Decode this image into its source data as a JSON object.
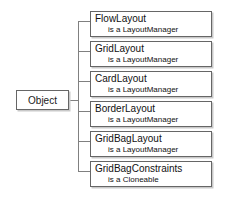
{
  "diagram": {
    "type": "class-hierarchy",
    "root": {
      "label": "Object"
    },
    "children": [
      {
        "name": "FlowLayout",
        "relation": "is a LayoutManager"
      },
      {
        "name": "GridLayout",
        "relation": "is a LayoutManager"
      },
      {
        "name": "CardLayout",
        "relation": "is a LayoutManager"
      },
      {
        "name": "BorderLayout",
        "relation": "is a LayoutManager"
      },
      {
        "name": "GridBagLayout",
        "relation": "is a LayoutManager"
      },
      {
        "name": "GridBagConstraints",
        "relation": "is a Cloneable"
      }
    ],
    "colors": {
      "background": "#ffffff",
      "border": "#666666",
      "shadow": "#c9c9c9",
      "connector": "#808080",
      "text": "#111111"
    }
  }
}
